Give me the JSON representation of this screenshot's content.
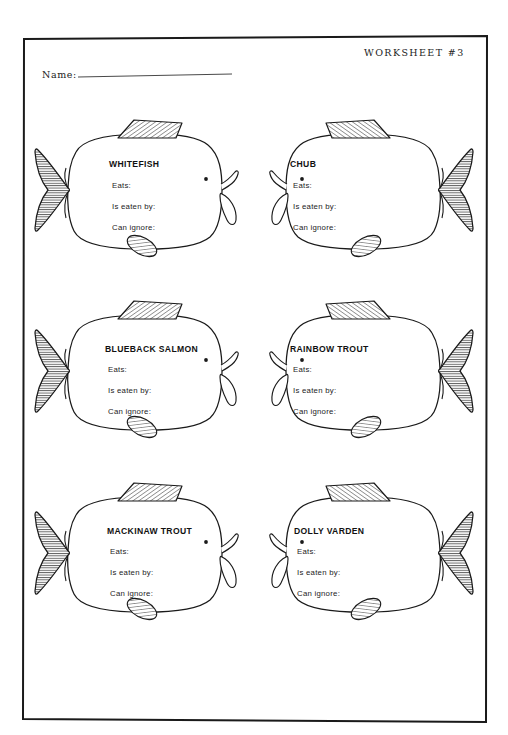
{
  "page": {
    "worksheet_label": "WORKSHEET #3",
    "name_label": "Name:",
    "border_color": "#1a1a1a",
    "ink_color": "#1a1a1a",
    "background_color": "#ffffff"
  },
  "fields": {
    "eats": "Eats:",
    "is_eaten_by": "Is eaten by:",
    "can_ignore": "Can ignore:"
  },
  "fish": [
    {
      "name": "WHITEFISH",
      "row": 1,
      "column": "left",
      "facing": "right",
      "eats": "Eats:",
      "is_eaten_by": "Is eaten by:",
      "can_ignore": "Can ignore:"
    },
    {
      "name": "CHUB",
      "row": 1,
      "column": "right",
      "facing": "left",
      "eats": "Eats:",
      "is_eaten_by": "Is eaten by:",
      "can_ignore": "Can ignore:"
    },
    {
      "name": "BLUEBACK SALMON",
      "row": 2,
      "column": "left",
      "facing": "right",
      "eats": "Eats:",
      "is_eaten_by": "Is eaten by:",
      "can_ignore": "Can ignore:"
    },
    {
      "name": "RAINBOW TROUT",
      "row": 2,
      "column": "right",
      "facing": "left",
      "eats": "Eats:",
      "is_eaten_by": "Is eaten by:",
      "can_ignore": "Can ignore:"
    },
    {
      "name": "MACKINAW TROUT",
      "row": 3,
      "column": "left",
      "facing": "right",
      "eats": "Eats:",
      "is_eaten_by": "Is eaten by:",
      "can_ignore": "Can ignore:"
    },
    {
      "name": "DOLLY VARDEN",
      "row": 3,
      "column": "right",
      "facing": "left",
      "eats": "Eats:",
      "is_eaten_by": "Is eaten by:",
      "can_ignore": "Can ignore:"
    }
  ]
}
